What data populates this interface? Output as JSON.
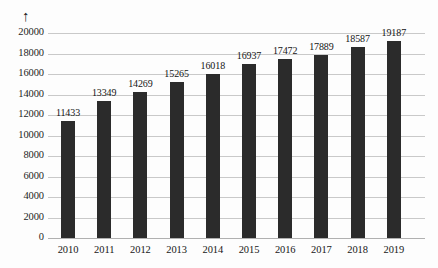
{
  "chart_data": {
    "type": "bar",
    "title": "",
    "subtitle": "",
    "xlabel": "",
    "ylabel": "",
    "categories": [
      "2010",
      "2011",
      "2012",
      "2013",
      "2014",
      "2015",
      "2016",
      "2017",
      "2018",
      "2019"
    ],
    "values": [
      11433,
      13349,
      14269,
      15265,
      16018,
      16937,
      17472,
      17889,
      18587,
      19187
    ],
    "data_labels": [
      "11433",
      "13349",
      "14269",
      "15265",
      "16018",
      "16937",
      "17472",
      "17889",
      "18587",
      "19187"
    ],
    "ylim": [
      0,
      20000
    ],
    "ytick_step": 2000,
    "ytick_labels": [
      "20000",
      "18000",
      "16000",
      "14000",
      "12000",
      "10000",
      "8000",
      "6000",
      "4000",
      "2000",
      "0"
    ],
    "ytick_values": [
      20000,
      18000,
      16000,
      14000,
      12000,
      10000,
      8000,
      6000,
      4000,
      2000,
      0
    ],
    "grid": true,
    "grid_orientation": "horizontal",
    "legend": null,
    "legend_position": "none",
    "series": [
      {
        "name": "",
        "values": [
          11433,
          13349,
          14269,
          15265,
          16018,
          16937,
          17472,
          17889,
          18587,
          19187
        ],
        "color": "#2b2b2b"
      }
    ],
    "annotations": [
      {
        "name": "y-axis-arrow",
        "glyph": "↑",
        "meaning": "upward axis arrow above top y tick"
      }
    ]
  },
  "colors": {
    "bar": "#2b2b2b",
    "gridline": "#c9c9c9",
    "baseline": "#b0b0b0",
    "text": "#161616",
    "background": "#fdfdfd"
  }
}
